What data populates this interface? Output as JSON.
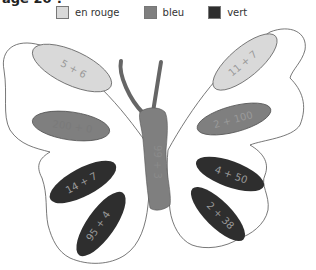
{
  "header": {
    "title": "age 20 ?"
  },
  "legend": [
    {
      "label": "en rouge",
      "color": "#d9d9d9"
    },
    {
      "label": "bleu",
      "color": "#7f7f7f"
    },
    {
      "label": "vert",
      "color": "#2e2e2e"
    }
  ],
  "butterfly": {
    "body": {
      "text": "99 + 3",
      "color": "#7f7f7f"
    },
    "left_wing": [
      {
        "text": "5 + 6",
        "color": "#d9d9d9"
      },
      {
        "text": "200 + 0",
        "color": "#7f7f7f"
      },
      {
        "text": "14 + 7",
        "color": "#2e2e2e"
      },
      {
        "text": "95 + 4",
        "color": "#2e2e2e"
      }
    ],
    "right_wing": [
      {
        "text": "11 + 7",
        "color": "#d9d9d9"
      },
      {
        "text": "2 + 100",
        "color": "#7f7f7f"
      },
      {
        "text": "4 + 50",
        "color": "#2e2e2e"
      },
      {
        "text": "2 + 38",
        "color": "#2e2e2e"
      }
    ]
  }
}
